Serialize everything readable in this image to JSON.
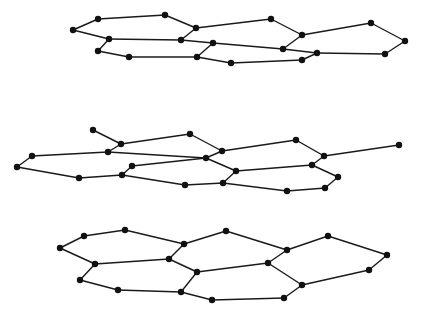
{
  "diagram": {
    "colors": {
      "bond": "#1a1a1a",
      "atom": "#111111",
      "background": "#ffffff"
    },
    "atom_radius": 3.2,
    "layers": [
      {
        "name": "top-layer",
        "nodes": [
          [
            73,
            30
          ],
          [
            98,
            19
          ],
          [
            165,
            15
          ],
          [
            196,
            28
          ],
          [
            271,
            19
          ],
          [
            302,
            35
          ],
          [
            371,
            23
          ],
          [
            405,
            41
          ],
          [
            109,
            39
          ],
          [
            181,
            40
          ],
          [
            213,
            43
          ],
          [
            283,
            49
          ],
          [
            317,
            53
          ],
          [
            385,
            54
          ],
          [
            98,
            51
          ],
          [
            129,
            57
          ],
          [
            197,
            57
          ],
          [
            231,
            63
          ],
          [
            302,
            60
          ]
        ],
        "edges": [
          [
            0,
            1
          ],
          [
            1,
            2
          ],
          [
            2,
            3
          ],
          [
            3,
            4
          ],
          [
            4,
            5
          ],
          [
            5,
            6
          ],
          [
            6,
            7
          ],
          [
            7,
            13
          ],
          [
            13,
            12
          ],
          [
            12,
            11
          ],
          [
            11,
            5
          ],
          [
            0,
            8
          ],
          [
            8,
            9
          ],
          [
            9,
            3
          ],
          [
            9,
            10
          ],
          [
            10,
            11
          ],
          [
            10,
            16
          ],
          [
            8,
            14
          ],
          [
            14,
            15
          ],
          [
            15,
            16
          ],
          [
            16,
            17
          ],
          [
            17,
            18
          ],
          [
            18,
            12
          ]
        ]
      },
      {
        "name": "middle-layer",
        "nodes": [
          [
            93,
            130
          ],
          [
            121,
            144
          ],
          [
            190,
            134
          ],
          [
            222,
            151
          ],
          [
            296,
            140
          ],
          [
            324,
            156
          ],
          [
            399,
            145
          ],
          [
            32,
            156
          ],
          [
            108,
            152
          ],
          [
            206,
            158
          ],
          [
            312,
            165
          ],
          [
            17,
            167
          ],
          [
            132,
            166
          ],
          [
            236,
            171
          ],
          [
            338,
            177
          ],
          [
            79,
            178
          ],
          [
            122,
            175
          ],
          [
            185,
            185
          ],
          [
            223,
            183
          ],
          [
            287,
            191
          ],
          [
            325,
            188
          ]
        ],
        "edges": [
          [
            0,
            1
          ],
          [
            1,
            2
          ],
          [
            2,
            3
          ],
          [
            3,
            4
          ],
          [
            4,
            5
          ],
          [
            5,
            6
          ],
          [
            1,
            8
          ],
          [
            7,
            8
          ],
          [
            7,
            11
          ],
          [
            8,
            9
          ],
          [
            3,
            9
          ],
          [
            9,
            13
          ],
          [
            12,
            9
          ],
          [
            13,
            10
          ],
          [
            10,
            5
          ],
          [
            10,
            14
          ],
          [
            14,
            20
          ],
          [
            20,
            19
          ],
          [
            19,
            18
          ],
          [
            18,
            13
          ],
          [
            11,
            15
          ],
          [
            15,
            16
          ],
          [
            16,
            12
          ],
          [
            16,
            17
          ],
          [
            17,
            18
          ]
        ]
      },
      {
        "name": "bottom-layer",
        "nodes": [
          [
            60,
            248
          ],
          [
            84,
            236
          ],
          [
            125,
            230
          ],
          [
            184,
            244
          ],
          [
            226,
            231
          ],
          [
            287,
            250
          ],
          [
            328,
            236
          ],
          [
            387,
            255
          ],
          [
            95,
            264
          ],
          [
            169,
            259
          ],
          [
            197,
            272
          ],
          [
            268,
            263
          ],
          [
            302,
            285
          ],
          [
            369,
            270
          ],
          [
            80,
            280
          ],
          [
            118,
            290
          ],
          [
            181,
            292
          ],
          [
            212,
            300
          ],
          [
            284,
            298
          ]
        ],
        "edges": [
          [
            0,
            1
          ],
          [
            1,
            2
          ],
          [
            2,
            3
          ],
          [
            3,
            4
          ],
          [
            4,
            5
          ],
          [
            5,
            6
          ],
          [
            6,
            7
          ],
          [
            0,
            8
          ],
          [
            8,
            9
          ],
          [
            3,
            9
          ],
          [
            9,
            10
          ],
          [
            10,
            11
          ],
          [
            5,
            11
          ],
          [
            11,
            12
          ],
          [
            12,
            13
          ],
          [
            13,
            7
          ],
          [
            8,
            14
          ],
          [
            14,
            15
          ],
          [
            15,
            16
          ],
          [
            16,
            10
          ],
          [
            16,
            17
          ],
          [
            17,
            18
          ],
          [
            18,
            12
          ]
        ]
      }
    ]
  }
}
